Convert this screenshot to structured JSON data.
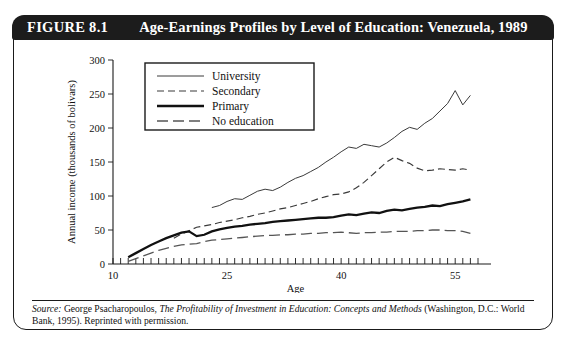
{
  "figure": {
    "label": "FIGURE 8.1",
    "title": "Age-Earnings Profiles by Level of Education: Venezuela, 1989"
  },
  "source": {
    "prefix": "Source:",
    "author": "George Psacharopoulos,",
    "work": "The Profitability of Investment in Education: Concepts and Methods",
    "publisher": "(Washington, D.C.: World Bank, 1995). Reprinted with permission."
  },
  "chart_data": {
    "type": "line",
    "title": "Age-Earnings Profiles by Level of Education: Venezuela, 1989",
    "xlabel": "Age",
    "ylabel": "Annual income (thousands of bolivars)",
    "xlim": [
      10,
      58
    ],
    "ylim": [
      0,
      300
    ],
    "xticks": [
      10,
      25,
      40,
      55
    ],
    "yticks": [
      0,
      50,
      100,
      150,
      200,
      250,
      300
    ],
    "xtick_minor_step": 1,
    "grid": false,
    "legend_position": "upper-left-inside",
    "series": [
      {
        "name": "University",
        "style": "solid-thin",
        "x": [
          23,
          24,
          25,
          26,
          27,
          28,
          29,
          30,
          31,
          32,
          33,
          34,
          35,
          36,
          37,
          38,
          39,
          40,
          41,
          42,
          43,
          44,
          45,
          46,
          47,
          48,
          49,
          50,
          51,
          52,
          53,
          54,
          55,
          56,
          57
        ],
        "y": [
          83,
          86,
          92,
          96,
          95,
          101,
          107,
          110,
          108,
          113,
          120,
          126,
          130,
          136,
          142,
          150,
          157,
          165,
          172,
          170,
          176,
          174,
          172,
          178,
          186,
          195,
          201,
          198,
          207,
          214,
          225,
          236,
          255,
          234,
          248
        ]
      },
      {
        "name": "Secondary",
        "style": "dashed",
        "x": [
          18,
          19,
          20,
          21,
          22,
          23,
          24,
          25,
          26,
          27,
          28,
          29,
          30,
          31,
          32,
          33,
          34,
          35,
          36,
          37,
          38,
          39,
          40,
          41,
          42,
          43,
          44,
          45,
          46,
          47,
          48,
          49,
          50,
          51,
          52,
          53,
          54,
          55,
          56,
          57
        ],
        "y": [
          38,
          44,
          49,
          54,
          56,
          58,
          61,
          63,
          65,
          68,
          70,
          73,
          75,
          78,
          81,
          83,
          86,
          89,
          92,
          96,
          99,
          102,
          103,
          106,
          112,
          120,
          130,
          140,
          150,
          157,
          152,
          148,
          141,
          137,
          138,
          140,
          139,
          138,
          140,
          138
        ]
      },
      {
        "name": "Primary",
        "style": "solid-thick",
        "x": [
          12,
          13,
          14,
          15,
          16,
          17,
          18,
          19,
          20,
          21,
          22,
          23,
          24,
          25,
          26,
          27,
          28,
          29,
          30,
          31,
          32,
          33,
          34,
          35,
          36,
          37,
          38,
          39,
          40,
          41,
          42,
          43,
          44,
          45,
          46,
          47,
          48,
          49,
          50,
          51,
          52,
          53,
          54,
          55,
          56,
          57
        ],
        "y": [
          10,
          16,
          22,
          28,
          33,
          38,
          42,
          46,
          48,
          41,
          43,
          48,
          51,
          53,
          55,
          56,
          58,
          59,
          60,
          62,
          63,
          64,
          65,
          66,
          67,
          68,
          68,
          69,
          71,
          73,
          72,
          74,
          76,
          75,
          78,
          80,
          79,
          81,
          83,
          84,
          86,
          85,
          88,
          90,
          92,
          95
        ]
      },
      {
        "name": "No education",
        "style": "long-dashed",
        "x": [
          12,
          13,
          14,
          15,
          16,
          17,
          18,
          19,
          20,
          21,
          22,
          23,
          24,
          25,
          26,
          27,
          28,
          29,
          30,
          31,
          32,
          33,
          34,
          35,
          36,
          37,
          38,
          39,
          40,
          41,
          42,
          43,
          44,
          45,
          46,
          47,
          48,
          49,
          50,
          51,
          52,
          53,
          54,
          55,
          56,
          57
        ],
        "y": [
          4,
          8,
          12,
          16,
          20,
          23,
          26,
          28,
          29,
          30,
          33,
          35,
          36,
          37,
          38,
          39,
          40,
          41,
          42,
          42,
          43,
          43,
          44,
          44,
          45,
          45,
          46,
          46,
          47,
          46,
          45,
          46,
          46,
          47,
          47,
          48,
          48,
          48,
          49,
          49,
          50,
          50,
          49,
          49,
          48,
          45
        ]
      }
    ],
    "legend": [
      {
        "label": "University",
        "style": "solid-thin"
      },
      {
        "label": "Secondary",
        "style": "dashed"
      },
      {
        "label": "Primary",
        "style": "solid-thick"
      },
      {
        "label": "No education",
        "style": "long-dashed"
      }
    ]
  }
}
